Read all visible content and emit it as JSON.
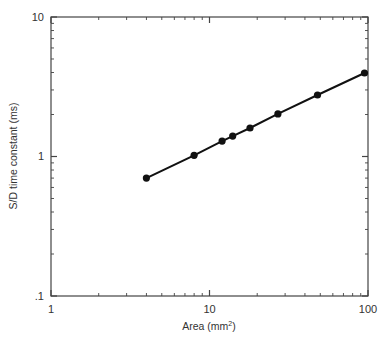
{
  "chart_data": {
    "type": "scatter",
    "title": "",
    "xlabel": "Area (mm",
    "xlabel_sup": "2",
    "xlabel_end": ")",
    "ylabel": "S/D time constant (ms)",
    "xscale": "log",
    "yscale": "log",
    "xlim": [
      1,
      100
    ],
    "ylim": [
      0.1,
      10
    ],
    "grid": false,
    "legend": null,
    "x_ticks": [
      {
        "value": 1,
        "label": "1"
      },
      {
        "value": 10,
        "label": "10"
      },
      {
        "value": 100,
        "label": "100"
      }
    ],
    "y_ticks": [
      {
        "value": 0.1,
        "label": ".1"
      },
      {
        "value": 1,
        "label": "1"
      },
      {
        "value": 10,
        "label": "10"
      }
    ],
    "series": [
      {
        "name": "S/D time constant",
        "marker": "filled-circle",
        "line": "connected",
        "color": "#111111",
        "x": [
          4,
          8,
          12,
          14,
          18,
          27,
          48,
          95
        ],
        "y": [
          0.7,
          1.02,
          1.29,
          1.4,
          1.6,
          2.02,
          2.76,
          3.97
        ]
      }
    ]
  },
  "labels": {
    "x_tick_1": "1",
    "x_tick_10": "10",
    "x_tick_100": "100",
    "y_tick_01": ".1",
    "y_tick_1": "1",
    "y_tick_10": "10",
    "xlabel": "Area (mm",
    "xlabel_sup": "2",
    "xlabel_end": ")",
    "ylabel": "S/D time constant (ms)"
  }
}
